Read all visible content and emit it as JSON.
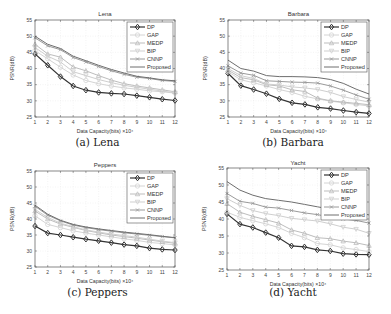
{
  "chart_data": [
    {
      "type": "line",
      "title": "Lena",
      "caption": "(a) Lena",
      "xlabel": "Data Capacity(bits) ×10⁴",
      "ylabel": "PSNR(dB)",
      "x": [
        1,
        2,
        3,
        4,
        5,
        6,
        7,
        8,
        9,
        10,
        11,
        12
      ],
      "xticks": [
        "1",
        "2",
        "3",
        "4",
        "5",
        "6",
        "7",
        "8",
        "9",
        "10",
        "11",
        "12"
      ],
      "yticks": [
        "25",
        "30",
        "35",
        "40",
        "45",
        "50",
        "55"
      ],
      "ylim": [
        25,
        55
      ],
      "grid": true,
      "legend_position": "upper right",
      "series": [
        {
          "name": "DP",
          "values": [
            44.5,
            41.0,
            37.5,
            34.6,
            33.3,
            32.6,
            32.3,
            32.1,
            31.6,
            31.1,
            30.5,
            30.1
          ]
        },
        {
          "name": "GAP",
          "values": [
            45.5,
            43.0,
            40.4,
            38.0,
            36.3,
            35.3,
            34.6,
            34.0,
            33.6,
            33.1,
            32.8,
            32.4
          ]
        },
        {
          "name": "MEDP",
          "values": [
            47.5,
            44.5,
            43.5,
            40.5,
            39.3,
            37.8,
            36.4,
            35.3,
            34.6,
            34.0,
            33.4,
            32.8
          ]
        },
        {
          "name": "BIP",
          "values": [
            46.5,
            43.8,
            42.0,
            39.0,
            37.8,
            36.6,
            35.6,
            34.8,
            34.2,
            33.6,
            33.0,
            32.5
          ]
        },
        {
          "name": "CNNP",
          "values": [
            49.5,
            47.0,
            45.8,
            43.4,
            42.0,
            40.6,
            39.3,
            38.2,
            37.3,
            36.9,
            36.3,
            36.0
          ]
        },
        {
          "name": "Proposed",
          "values": [
            50.0,
            47.5,
            46.2,
            43.8,
            42.4,
            41.0,
            39.7,
            38.6,
            37.6,
            37.1,
            36.5,
            36.2
          ]
        }
      ]
    },
    {
      "type": "line",
      "title": "Barbara",
      "caption": "(b) Barbara",
      "xlabel": "Data Capacity(bits) ×10⁴",
      "ylabel": "PSNR(dB)",
      "x": [
        1,
        2,
        3,
        4,
        5,
        6,
        7,
        8,
        9,
        10,
        11,
        12
      ],
      "xticks": [
        "1",
        "2",
        "3",
        "4",
        "5",
        "6",
        "7",
        "8",
        "9",
        "10",
        "11",
        "12"
      ],
      "yticks": [
        "25",
        "30",
        "35",
        "40",
        "45",
        "50",
        "55"
      ],
      "ylim": [
        25,
        55
      ],
      "grid": true,
      "legend_position": "upper right",
      "series": [
        {
          "name": "DP",
          "values": [
            38.5,
            34.7,
            33.5,
            32.2,
            30.6,
            29.4,
            28.9,
            28.0,
            27.6,
            27.0,
            26.5,
            26.1
          ]
        },
        {
          "name": "GAP",
          "values": [
            39.0,
            36.5,
            35.6,
            34.6,
            33.5,
            32.6,
            31.4,
            30.6,
            29.9,
            29.4,
            28.9,
            28.4
          ]
        },
        {
          "name": "MEDP",
          "values": [
            39.5,
            37.2,
            36.5,
            35.0,
            34.6,
            33.4,
            32.9,
            30.8,
            30.0,
            29.6,
            29.2,
            28.8
          ]
        },
        {
          "name": "BIP",
          "values": [
            40.0,
            37.8,
            36.9,
            35.2,
            34.9,
            34.3,
            34.0,
            33.5,
            32.6,
            31.3,
            30.4,
            29.6
          ]
        },
        {
          "name": "CNNP",
          "values": [
            40.8,
            38.6,
            37.9,
            36.2,
            36.0,
            35.8,
            35.7,
            35.5,
            34.6,
            33.3,
            31.8,
            30.5
          ]
        },
        {
          "name": "Proposed",
          "values": [
            42.6,
            40.0,
            39.2,
            37.8,
            37.5,
            37.5,
            37.4,
            37.2,
            36.6,
            35.4,
            33.6,
            32.1
          ]
        }
      ]
    },
    {
      "type": "line",
      "title": "Peppers",
      "caption": "(c) Peppers",
      "xlabel": "Data Capacity(bits) ×10⁴",
      "ylabel": "PSNR(dB)",
      "x": [
        1,
        2,
        3,
        4,
        5,
        6,
        7,
        8,
        9,
        10,
        11,
        12
      ],
      "xticks": [
        "1",
        "2",
        "3",
        "4",
        "5",
        "6",
        "7",
        "8",
        "9",
        "10",
        "11",
        "12"
      ],
      "yticks": [
        "25",
        "30",
        "35",
        "40",
        "45",
        "50",
        "55"
      ],
      "ylim": [
        25,
        55
      ],
      "grid": true,
      "legend_position": "upper right",
      "series": [
        {
          "name": "DP",
          "values": [
            37.8,
            35.6,
            35.0,
            34.3,
            33.7,
            33.2,
            32.6,
            32.0,
            31.6,
            30.9,
            30.5,
            30.3
          ]
        },
        {
          "name": "GAP",
          "values": [
            41.0,
            38.3,
            37.3,
            36.3,
            35.6,
            35.0,
            34.4,
            33.8,
            33.3,
            32.7,
            32.3,
            31.9
          ]
        },
        {
          "name": "MEDP",
          "values": [
            42.5,
            40.0,
            38.4,
            37.4,
            36.4,
            35.7,
            35.0,
            34.5,
            34.0,
            33.4,
            32.9,
            32.4
          ]
        },
        {
          "name": "BIP",
          "values": [
            43.0,
            40.5,
            38.7,
            37.6,
            36.6,
            35.9,
            35.3,
            34.8,
            34.3,
            33.7,
            33.1,
            32.6
          ]
        },
        {
          "name": "CNNP",
          "values": [
            44.0,
            41.2,
            39.4,
            38.1,
            37.3,
            36.7,
            36.2,
            35.7,
            35.3,
            34.9,
            34.5,
            34.1
          ]
        },
        {
          "name": "Proposed",
          "values": [
            44.3,
            41.5,
            39.6,
            38.3,
            37.5,
            36.9,
            36.4,
            35.9,
            35.5,
            35.1,
            34.6,
            34.2
          ]
        }
      ]
    },
    {
      "type": "line",
      "title": "Yacht",
      "caption": "(d) Yacht",
      "xlabel": "Data Capacity(bits) ×10⁴",
      "ylabel": "PSNR(dB)",
      "x": [
        1,
        2,
        3,
        4,
        5,
        6,
        7,
        8,
        9,
        10,
        11,
        12
      ],
      "xticks": [
        "1",
        "2",
        "3",
        "4",
        "5",
        "6",
        "7",
        "8",
        "9",
        "10",
        "11",
        "12"
      ],
      "yticks": [
        "25",
        "30",
        "35",
        "40",
        "45",
        "50",
        "55"
      ],
      "ylim": [
        25,
        55
      ],
      "grid": true,
      "legend_position": "upper right",
      "series": [
        {
          "name": "DP",
          "values": [
            41.5,
            38.5,
            37.5,
            36.0,
            34.5,
            32.1,
            31.8,
            30.9,
            30.6,
            29.8,
            29.6,
            29.5
          ]
        },
        {
          "name": "GAP",
          "values": [
            42.0,
            40.5,
            39.5,
            38.6,
            37.5,
            35.8,
            34.5,
            32.8,
            32.4,
            31.5,
            31.0,
            30.4
          ]
        },
        {
          "name": "MEDP",
          "values": [
            44.5,
            42.0,
            40.8,
            39.8,
            38.8,
            36.8,
            35.8,
            34.5,
            34.2,
            33.5,
            33.0,
            32.2
          ]
        },
        {
          "name": "BIP",
          "values": [
            46.0,
            44.0,
            42.5,
            41.6,
            41.0,
            40.2,
            39.8,
            39.4,
            38.6,
            37.6,
            37.0,
            35.8
          ]
        },
        {
          "name": "CNNP",
          "values": [
            47.5,
            45.2,
            44.6,
            43.5,
            43.2,
            42.5,
            41.8,
            41.3,
            40.6,
            40.0,
            39.6,
            38.8
          ]
        },
        {
          "name": "Proposed",
          "values": [
            51.0,
            48.5,
            47.0,
            46.0,
            45.5,
            45.0,
            44.3,
            43.6,
            42.9,
            42.4,
            41.9,
            41.2
          ]
        }
      ]
    }
  ],
  "series_styles": [
    {
      "name": "DP",
      "color": "#333333",
      "marker": "diamond",
      "width": 1.2
    },
    {
      "name": "GAP",
      "color": "#d4d4d4",
      "marker": "circle",
      "width": 1
    },
    {
      "name": "MEDP",
      "color": "#bdbdbd",
      "marker": "triangle",
      "width": 1
    },
    {
      "name": "BIP",
      "color": "#cfcfcf",
      "marker": "triangle-down",
      "width": 1
    },
    {
      "name": "CNNP",
      "color": "#9a9a9a",
      "marker": "x",
      "width": 1
    },
    {
      "name": "Proposed",
      "color": "#6e6e6e",
      "marker": "none",
      "width": 1
    }
  ]
}
